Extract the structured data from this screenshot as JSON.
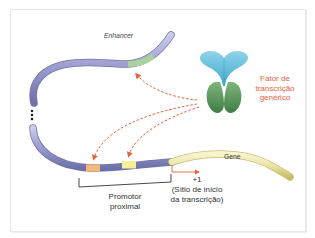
{
  "diagram": {
    "labels": {
      "enhancer": "Enhancer",
      "transcription_factor_line1": "Fator de",
      "transcription_factor_line2": "transcrição",
      "transcription_factor_line3": "genérico",
      "gene": "Gene",
      "promoter_line1": "Promotor",
      "promoter_line2": "proximal",
      "start_site_line1": "+1",
      "start_site_line2": "(Sítio de início",
      "start_site_line3": "da transcrição)"
    },
    "colors": {
      "dna": "#9c9fcf",
      "dna_dark": "#6e71a8",
      "enhancer_region": "#a9d39a",
      "promoter_orange": "#f6b97a",
      "promoter_yellow": "#f7ef96",
      "gene": "#ebe5a8",
      "gene_dark": "#c9bf6a",
      "tf_top": "#6cc3df",
      "tf_bottom": "#5c9a5c",
      "arrow": "#e8603c",
      "label_red": "#e8603c",
      "text": "#333333"
    }
  }
}
